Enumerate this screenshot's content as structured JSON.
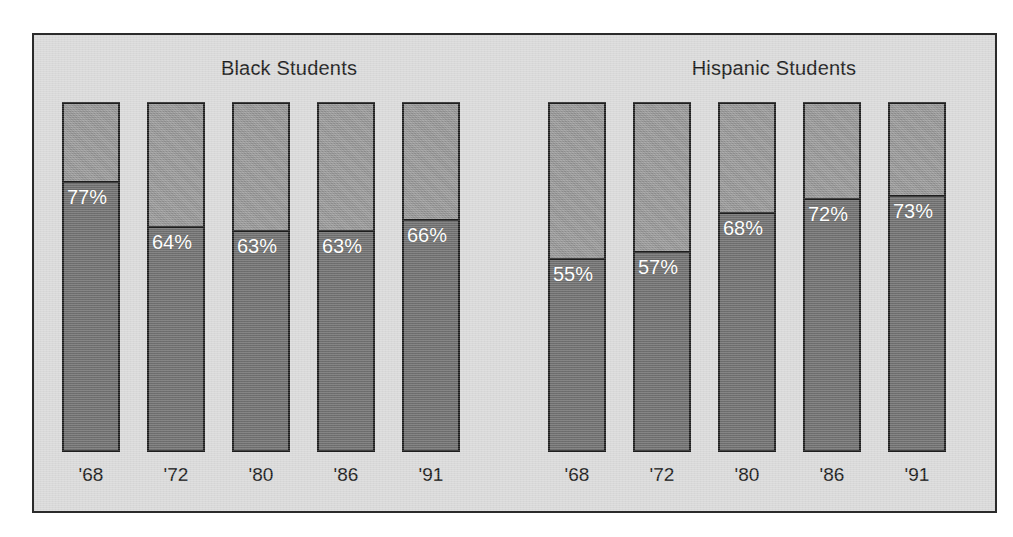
{
  "chart_data": {
    "type": "bar",
    "title": "",
    "subtitle": "",
    "xlabel": "",
    "ylabel": "",
    "ylim": [
      0,
      100
    ],
    "grid": false,
    "legend_position": "none",
    "stacked": true,
    "value_unit": "%",
    "categories": [
      "'68",
      "'72",
      "'80",
      "'86",
      "'91"
    ],
    "groups": [
      {
        "name": "Black Students",
        "categories": [
          "'68",
          "'72",
          "'80",
          "'86",
          "'91"
        ],
        "values": [
          77,
          64,
          63,
          63,
          66
        ],
        "value_labels": [
          "77%",
          "64%",
          "63%",
          "63%",
          "66%"
        ]
      },
      {
        "name": "Hispanic Students",
        "categories": [
          "'68",
          "'72",
          "'80",
          "'86",
          "'91"
        ],
        "values": [
          55,
          57,
          68,
          72,
          73
        ],
        "value_labels": [
          "55%",
          "57%",
          "68%",
          "72%",
          "73%"
        ]
      }
    ],
    "series": [
      {
        "name": "Black Students",
        "values": [
          77,
          64,
          63,
          63,
          66
        ]
      },
      {
        "name": "Hispanic Students",
        "values": [
          55,
          57,
          68,
          72,
          73
        ]
      }
    ],
    "colors": {
      "segment_filled": "#6e6e6e",
      "segment_remainder": "#949494",
      "bar_outline": "#1e1e1e",
      "panel_background": "#d9d9d9",
      "frame_border": "#2b2b2b",
      "value_label": "#ffffff",
      "axis_label": "#1a1a1a",
      "page_background": "#ffffff"
    }
  },
  "panel": {
    "groups": [
      {
        "title": "Black Students",
        "bars": [
          {
            "label": "'68",
            "value": 77,
            "value_label": "77%"
          },
          {
            "label": "'72",
            "value": 64,
            "value_label": "64%"
          },
          {
            "label": "'80",
            "value": 63,
            "value_label": "63%"
          },
          {
            "label": "'86",
            "value": 63,
            "value_label": "63%"
          },
          {
            "label": "'91",
            "value": 66,
            "value_label": "66%"
          }
        ]
      },
      {
        "title": "Hispanic Students",
        "bars": [
          {
            "label": "'68",
            "value": 55,
            "value_label": "55%"
          },
          {
            "label": "'72",
            "value": 57,
            "value_label": "57%"
          },
          {
            "label": "'80",
            "value": 68,
            "value_label": "68%"
          },
          {
            "label": "'86",
            "value": 72,
            "value_label": "72%"
          },
          {
            "label": "'91",
            "value": 73,
            "value_label": "73%"
          }
        ]
      }
    ]
  }
}
